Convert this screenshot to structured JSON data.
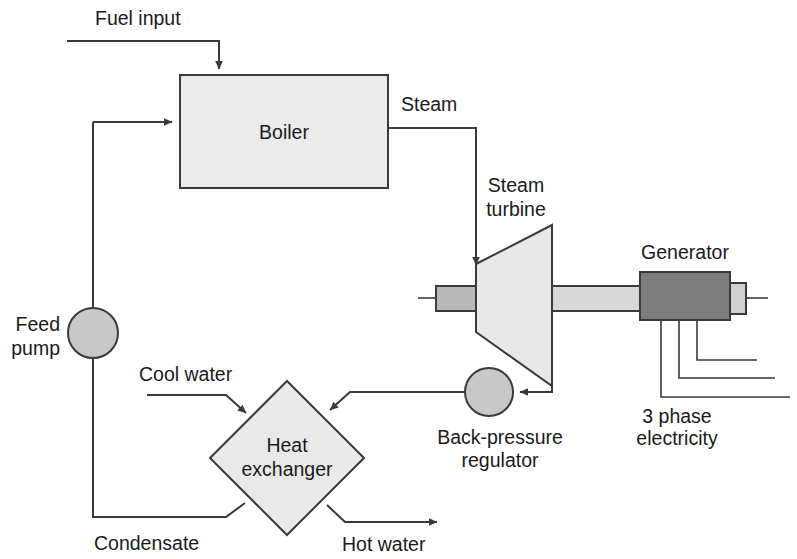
{
  "diagram": {
    "colors": {
      "line": "#3a3a3a",
      "text": "#1a1a1a",
      "boiler_fill": "#ebebeb",
      "turbine_fill": "#e8e8e8",
      "heat_exchanger_fill": "#e9e9e9",
      "pump_fill": "#c8c8c8",
      "regulator_fill": "#c8c8c8",
      "generator_fill": "#7e7e7e",
      "shaft_fill": "#d8d8d8",
      "shaft_stub_fill": "#b9b9b9",
      "background": "#ffffff"
    },
    "nodes": [
      {
        "id": "boiler",
        "label": "Boiler",
        "shape": "rectangle"
      },
      {
        "id": "steam-turbine",
        "label": "Steam\nturbine",
        "label_line1": "Steam",
        "label_line2": "turbine",
        "shape": "trapezoid"
      },
      {
        "id": "generator",
        "label": "Generator",
        "shape": "rectangle"
      },
      {
        "id": "feed-pump",
        "label": "Feed\npump",
        "label_line1": "Feed",
        "label_line2": "pump",
        "shape": "circle"
      },
      {
        "id": "back-pressure-regulator",
        "label": "Back-pressure\nregulator",
        "label_line1": "Back-pressure",
        "label_line2": "regulator",
        "shape": "circle"
      },
      {
        "id": "heat-exchanger",
        "label": "Heat\nexchanger",
        "label_line1": "Heat",
        "label_line2": "exchanger",
        "shape": "diamond"
      }
    ],
    "flow_labels": [
      {
        "id": "fuel-input",
        "text": "Fuel input"
      },
      {
        "id": "steam",
        "text": "Steam"
      },
      {
        "id": "cool-water",
        "text": "Cool water"
      },
      {
        "id": "condensate",
        "text": "Condensate"
      },
      {
        "id": "hot-water",
        "text": "Hot water"
      },
      {
        "id": "three-phase-electricity",
        "text": "3 phase\nelectricity",
        "line1": "3 phase",
        "line2": "electricity"
      }
    ],
    "labels": {
      "fuel_input": "Fuel input",
      "boiler": "Boiler",
      "steam": "Steam",
      "steam_turbine_l1": "Steam",
      "steam_turbine_l2": "turbine",
      "generator": "Generator",
      "feed_pump_l1": "Feed",
      "feed_pump_l2": "pump",
      "cool_water": "Cool water",
      "heat_exchanger_l1": "Heat",
      "heat_exchanger_l2": "exchanger",
      "back_pressure_l1": "Back-pressure",
      "back_pressure_l2": "regulator",
      "condensate": "Condensate",
      "hot_water": "Hot water",
      "three_phase_l1": "3 phase",
      "three_phase_l2": "electricity"
    }
  }
}
